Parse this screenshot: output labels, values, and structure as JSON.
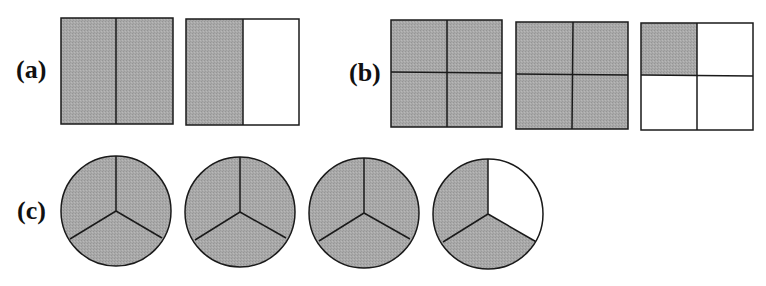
{
  "figure": {
    "panels": [
      {
        "label": "(a)",
        "shape": "square",
        "divisions": "2 vertical halves",
        "parts_per_shape": 2,
        "shapes": [
          {
            "shaded_parts": 2,
            "total_parts": 2
          },
          {
            "shaded_parts": 1,
            "total_parts": 2
          }
        ],
        "represents": "3/2"
      },
      {
        "label": "(b)",
        "shape": "square",
        "divisions": "2x2 quarters",
        "parts_per_shape": 4,
        "shapes": [
          {
            "shaded_parts": 4,
            "total_parts": 4
          },
          {
            "shaded_parts": 4,
            "total_parts": 4
          },
          {
            "shaded_parts": 1,
            "total_parts": 4
          }
        ],
        "represents": "9/4"
      },
      {
        "label": "(c)",
        "shape": "circle",
        "divisions": "3 equal sectors",
        "parts_per_shape": 3,
        "shapes": [
          {
            "shaded_parts": 3,
            "total_parts": 3
          },
          {
            "shaded_parts": 3,
            "total_parts": 3
          },
          {
            "shaded_parts": 3,
            "total_parts": 3
          },
          {
            "shaded_parts": 2,
            "total_parts": 3
          }
        ],
        "represents": "11/3"
      }
    ],
    "colors": {
      "shaded": "#a6a6a6",
      "unshaded": "#ffffff",
      "stroke": "#1a1a1a"
    }
  }
}
